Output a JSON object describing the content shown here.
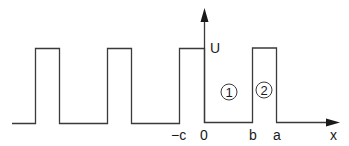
{
  "diagram": {
    "axis": {
      "x_label": "x",
      "y_label": "U"
    },
    "ticks": {
      "neg_c": "−c",
      "zero": "0",
      "b": "b",
      "a": "a"
    },
    "regions": {
      "region1": "1",
      "region2": "2"
    },
    "colors": {
      "line": "#3a3a3a",
      "text": "#1a1a1a",
      "background": "#ffffff"
    }
  }
}
